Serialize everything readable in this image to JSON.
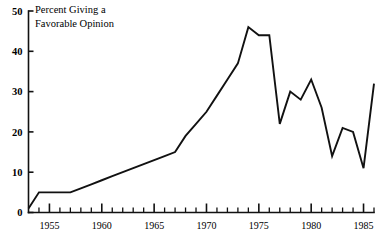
{
  "caption": {
    "line1": "Percent Giving a",
    "line2": "Favorable Opinion"
  },
  "chart_data": {
    "type": "line",
    "title": "Percent Giving a Favorable Opinion",
    "xlabel": "",
    "ylabel": "Percent Giving a Favorable Opinion",
    "xlim": [
      1953,
      1986
    ],
    "ylim": [
      0,
      50
    ],
    "yticks": [
      0,
      10,
      20,
      30,
      40,
      50
    ],
    "xticks_major": [
      1955,
      1960,
      1965,
      1970,
      1975,
      1980,
      1985
    ],
    "xticks_minor_step": 1,
    "grid": false,
    "legend": null,
    "line_color": "#111111",
    "x": [
      1953,
      1954,
      1955,
      1956,
      1957,
      1958,
      1959,
      1960,
      1961,
      1962,
      1963,
      1964,
      1965,
      1966,
      1967,
      1968,
      1969,
      1970,
      1971,
      1972,
      1973,
      1974,
      1975,
      1976,
      1977,
      1978,
      1979,
      1980,
      1981,
      1982,
      1983,
      1984,
      1985,
      1986
    ],
    "values": [
      1,
      5,
      5,
      5,
      5,
      6,
      7,
      8,
      9,
      10,
      11,
      12,
      13,
      14,
      15,
      19,
      22,
      25,
      29,
      33,
      37,
      46,
      44,
      44,
      22,
      30,
      28,
      33,
      26,
      14,
      21,
      20,
      11,
      32
    ],
    "annotations": [
      {
        "text": "Percent Giving a Favorable Opinion",
        "x": 1954,
        "y": 49
      }
    ]
  },
  "axis": {
    "y_tick_labels": [
      "50",
      "40",
      "30",
      "20",
      "10",
      "0"
    ],
    "x_tick_labels": [
      "1955",
      "1960",
      "1965",
      "1970",
      "1975",
      "1980",
      "1985"
    ]
  }
}
